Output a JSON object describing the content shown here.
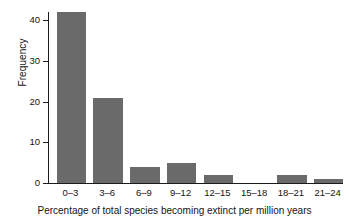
{
  "chart_data": {
    "type": "bar",
    "title": "",
    "subtitle": "",
    "xlabel": "Percentage of total species becoming extinct per million years",
    "ylabel": "Frequency",
    "categories": [
      "0–3",
      "3–6",
      "6–9",
      "9–12",
      "12–15",
      "15–18",
      "18–21",
      "21–24"
    ],
    "values": [
      42,
      21,
      4,
      5,
      2,
      0,
      2,
      1
    ],
    "ylim": [
      0,
      42
    ],
    "yticks": [
      0,
      10,
      20,
      30,
      40
    ],
    "ytick_labels": [
      "0",
      "10",
      "20",
      "30",
      "40"
    ],
    "grid": false,
    "legend": false,
    "legend_position": "none",
    "bar_color": "#6a6a6a",
    "axis_color": "#1b1b1b",
    "background_color": "#ffffff"
  },
  "axis": {
    "y_title": "Frequency",
    "x_title": "Percentage of total species becoming extinct per million years"
  }
}
